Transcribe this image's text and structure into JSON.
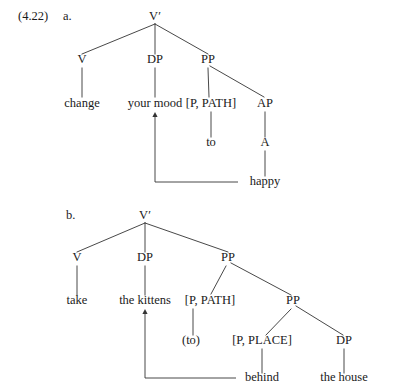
{
  "figure": {
    "example_number": "(4.22)",
    "background_color": "#ffffff",
    "ink_color": "#1a1a1a",
    "line_color": "#333333"
  },
  "trees": [
    {
      "id": "tree-a",
      "sub_label": "a.",
      "sub_label_x": 63,
      "sub_label_y": 20,
      "root_text": "V′",
      "nodes": [
        {
          "name": "root-v-bar",
          "text": "V′",
          "x": 155,
          "y": 20
        },
        {
          "name": "node-v",
          "text": "V",
          "x": 82,
          "y": 63
        },
        {
          "name": "node-dp",
          "text": "DP",
          "x": 155,
          "y": 63
        },
        {
          "name": "node-pp",
          "text": "PP",
          "x": 208,
          "y": 63
        },
        {
          "name": "leaf-change",
          "text": "change",
          "x": 82,
          "y": 107
        },
        {
          "name": "leaf-your-mood",
          "text": "your mood",
          "x": 155,
          "y": 107
        },
        {
          "name": "leaf-p-path",
          "text": "[P, PATH]",
          "x": 211,
          "y": 107
        },
        {
          "name": "node-ap",
          "text": "AP",
          "x": 265,
          "y": 107
        },
        {
          "name": "leaf-to",
          "text": "to",
          "x": 211,
          "y": 146
        },
        {
          "name": "node-a",
          "text": "A",
          "x": 265,
          "y": 146
        },
        {
          "name": "leaf-happy",
          "text": "happy",
          "x": 265,
          "y": 185
        }
      ],
      "edges": [
        {
          "name": "edge-root-to-v",
          "x1": 155,
          "y1": 24,
          "x2": 82,
          "y2": 54
        },
        {
          "name": "edge-root-to-dp",
          "x1": 155,
          "y1": 24,
          "x2": 155,
          "y2": 54
        },
        {
          "name": "edge-root-to-pp",
          "x1": 155,
          "y1": 24,
          "x2": 208,
          "y2": 54
        },
        {
          "name": "edge-v-to-change",
          "x1": 82,
          "y1": 68,
          "x2": 82,
          "y2": 97
        },
        {
          "name": "edge-dp-to-your-mood",
          "x1": 155,
          "y1": 68,
          "x2": 155,
          "y2": 97
        },
        {
          "name": "edge-pp-to-p-path",
          "x1": 208,
          "y1": 68,
          "x2": 209,
          "y2": 97
        },
        {
          "name": "edge-pp-to-ap",
          "x1": 210,
          "y1": 66,
          "x2": 264,
          "y2": 97
        },
        {
          "name": "edge-p-path-to-to",
          "x1": 211,
          "y1": 112,
          "x2": 211,
          "y2": 137
        },
        {
          "name": "edge-ap-to-a",
          "x1": 265,
          "y1": 112,
          "x2": 265,
          "y2": 137
        },
        {
          "name": "edge-a-to-happy",
          "x1": 265,
          "y1": 151,
          "x2": 265,
          "y2": 176
        }
      ],
      "movement": {
        "name": "movement-happy-to-dp",
        "from_text": "happy",
        "to_text": "your mood",
        "path": "M 238 182 L 155 182 L 155 115",
        "arrow_x": 155,
        "arrow_y": 112
      }
    },
    {
      "id": "tree-b",
      "sub_label": "b.",
      "sub_label_x": 66,
      "sub_label_y": 219,
      "root_text": "V′",
      "nodes": [
        {
          "name": "root-v-bar",
          "text": "V′",
          "x": 145,
          "y": 219
        },
        {
          "name": "node-v",
          "text": "V",
          "x": 77,
          "y": 261
        },
        {
          "name": "node-dp-subject",
          "text": "DP",
          "x": 145,
          "y": 261
        },
        {
          "name": "node-pp-outer",
          "text": "PP",
          "x": 228,
          "y": 261
        },
        {
          "name": "leaf-take",
          "text": "take",
          "x": 77,
          "y": 304
        },
        {
          "name": "leaf-the-kittens",
          "text": "the kittens",
          "x": 145,
          "y": 304
        },
        {
          "name": "leaf-p-path",
          "text": "[P, PATH]",
          "x": 210,
          "y": 304
        },
        {
          "name": "node-pp-inner",
          "text": "PP",
          "x": 293,
          "y": 304
        },
        {
          "name": "leaf-to-optional",
          "text": "(to)",
          "x": 191,
          "y": 344
        },
        {
          "name": "leaf-p-place",
          "text": "[P, PLACE]",
          "x": 262,
          "y": 344
        },
        {
          "name": "node-dp-object",
          "text": "DP",
          "x": 344,
          "y": 344
        },
        {
          "name": "leaf-behind",
          "text": "behind",
          "x": 262,
          "y": 381
        },
        {
          "name": "leaf-the-house",
          "text": "the house",
          "x": 344,
          "y": 381
        }
      ],
      "edges": [
        {
          "name": "edge-root-to-v",
          "x1": 145,
          "y1": 223,
          "x2": 77,
          "y2": 252
        },
        {
          "name": "edge-root-to-dp",
          "x1": 145,
          "y1": 223,
          "x2": 145,
          "y2": 252
        },
        {
          "name": "edge-root-to-pp",
          "x1": 145,
          "y1": 223,
          "x2": 228,
          "y2": 252
        },
        {
          "name": "edge-v-to-take",
          "x1": 77,
          "y1": 266,
          "x2": 77,
          "y2": 295
        },
        {
          "name": "edge-dp-to-kittens",
          "x1": 145,
          "y1": 266,
          "x2": 145,
          "y2": 295
        },
        {
          "name": "edge-pp-to-p-path",
          "x1": 226,
          "y1": 266,
          "x2": 211,
          "y2": 294
        },
        {
          "name": "edge-pp-to-pp-inner",
          "x1": 231,
          "y1": 263,
          "x2": 291,
          "y2": 295
        },
        {
          "name": "edge-p-path-to-to",
          "x1": 193,
          "y1": 309,
          "x2": 193,
          "y2": 335
        },
        {
          "name": "edge-pp-inner-to-place",
          "x1": 291,
          "y1": 309,
          "x2": 266,
          "y2": 335
        },
        {
          "name": "edge-pp-inner-to-dp",
          "x1": 296,
          "y1": 306,
          "x2": 343,
          "y2": 335
        },
        {
          "name": "edge-place-to-behind",
          "x1": 262,
          "y1": 349,
          "x2": 262,
          "y2": 373
        },
        {
          "name": "edge-dp-to-the-house",
          "x1": 344,
          "y1": 349,
          "x2": 344,
          "y2": 373
        }
      ],
      "movement": {
        "name": "movement-behind-to-dp",
        "from_text": "behind",
        "to_text": "the kittens",
        "path": "M 236 378 L 145 378 L 145 312",
        "arrow_x": 145,
        "arrow_y": 309
      }
    }
  ]
}
